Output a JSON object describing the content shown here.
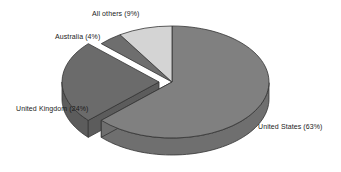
{
  "chart_data": {
    "type": "pie",
    "title": "",
    "subtitle": "",
    "xlabel": "",
    "ylabel": "",
    "three_d": true,
    "exploded_slices": [
      "United Kingdom"
    ],
    "start_angle_deg": 0,
    "direction": "clockwise",
    "legend_position": "none",
    "labels_on_slices": true,
    "grid": false,
    "background_color": "#ffffff",
    "outline_color": "#333333",
    "categories": [
      "United States",
      "United Kingdom",
      "All others",
      "Australia"
    ],
    "values": [
      63,
      24,
      9,
      4
    ],
    "unit": "%",
    "slices": [
      {
        "name": "United States",
        "value": 63,
        "label": "United States (63%)",
        "color": "#808080",
        "side_color": "#6f6f6f",
        "exploded": false
      },
      {
        "name": "United Kingdom",
        "value": 24,
        "label": "United Kingdom (24%)",
        "color": "#6b6b6b",
        "side_color": "#5c5c5c",
        "exploded": true
      },
      {
        "name": "Australia",
        "value": 4,
        "label": "Australia (4%)",
        "color": "#6e6e6e",
        "side_color": "#5f5f5f",
        "exploded": false
      },
      {
        "name": "All others",
        "value": 9,
        "label": "All others (9%)",
        "color": "#d4d4d4",
        "side_color": "#b8b8b8",
        "exploded": false
      }
    ]
  },
  "labels": {
    "united_states": "United States (63%)",
    "united_kingdom": "United Kingdom (24%)",
    "australia": "Australia (4%)",
    "all_others": "All others (9%)"
  }
}
